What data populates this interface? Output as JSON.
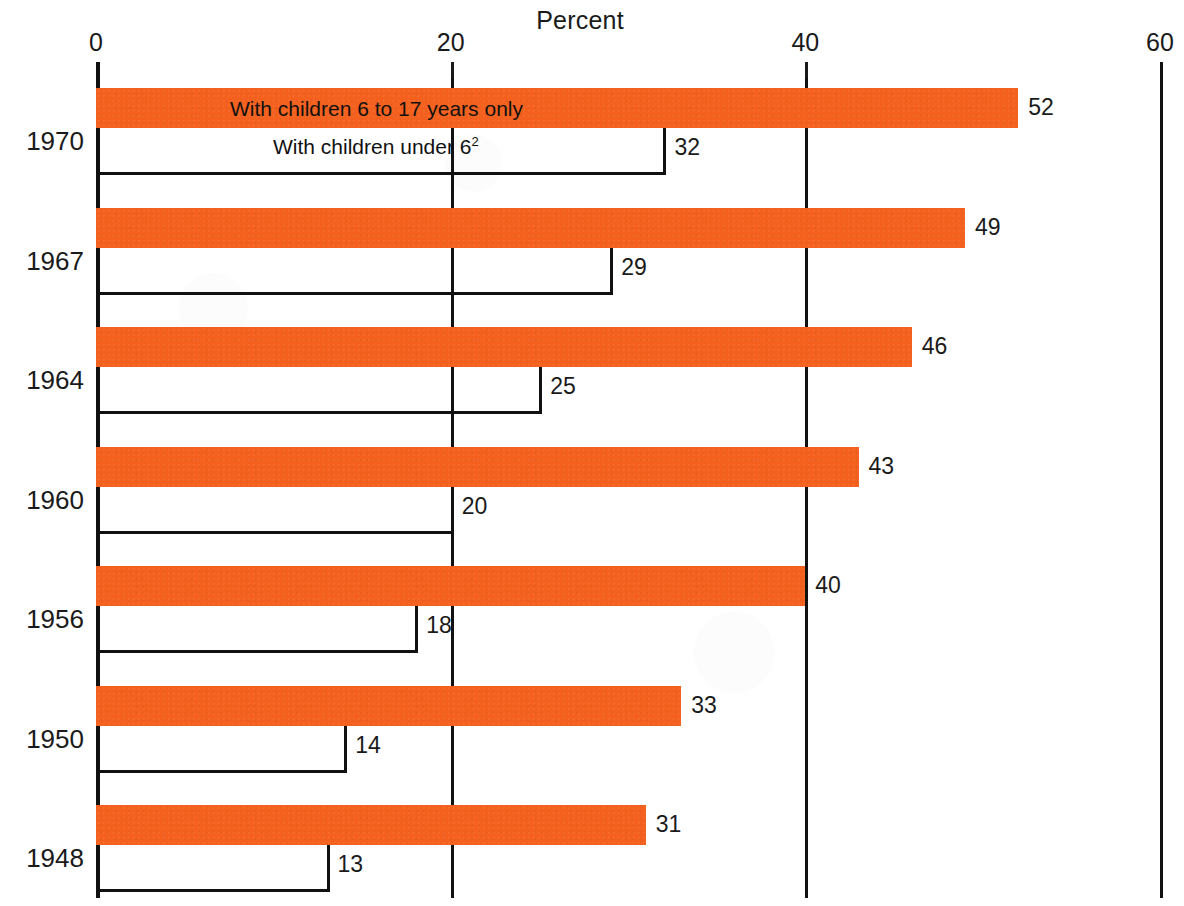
{
  "chart_data": {
    "type": "bar",
    "title": "Percent",
    "xlabel": "",
    "ylabel": "",
    "xlim": [
      0,
      60
    ],
    "grid": true,
    "orientation": "horizontal",
    "legend_position": "in-bar",
    "xticks": [
      "0",
      "20",
      "40",
      "60"
    ],
    "xtick_values": [
      0,
      20,
      40,
      60
    ],
    "categories": [
      "1970",
      "1967",
      "1964",
      "1960",
      "1956",
      "1950",
      "1948"
    ],
    "series": [
      {
        "name": "With children 6 to 17 years only",
        "values": [
          52,
          49,
          46,
          43,
          40,
          33,
          31
        ],
        "color": "#f4611e",
        "style": "filled"
      },
      {
        "name": "With children under 6",
        "name_footnote": "2",
        "values": [
          32,
          29,
          25,
          20,
          18,
          14,
          13
        ],
        "color": "#111111",
        "style": "outline"
      }
    ],
    "annotations": [
      "With children 6 to 17 years only",
      "With children under 6²"
    ]
  },
  "axis": {
    "title": "Percent",
    "ticks": [
      {
        "label": "0",
        "value": 0
      },
      {
        "label": "20",
        "value": 20
      },
      {
        "label": "40",
        "value": 40
      },
      {
        "label": "60",
        "value": 60
      }
    ]
  },
  "rows": [
    {
      "year": "1970",
      "top_value": "52",
      "bottom_value": "32",
      "top_note": "With children 6 to 17 years only",
      "bottom_note": "With children under 6",
      "bottom_note_sup": "2"
    },
    {
      "year": "1967",
      "top_value": "49",
      "bottom_value": "29"
    },
    {
      "year": "1964",
      "top_value": "46",
      "bottom_value": "25"
    },
    {
      "year": "1960",
      "top_value": "43",
      "bottom_value": "20"
    },
    {
      "year": "1956",
      "top_value": "40",
      "bottom_value": "18"
    },
    {
      "year": "1950",
      "top_value": "33",
      "bottom_value": "14"
    },
    {
      "year": "1948",
      "top_value": "31",
      "bottom_value": "13"
    }
  ],
  "colors": {
    "bar_fill": "#f4611e",
    "ink": "#111111",
    "background": "#ffffff"
  }
}
